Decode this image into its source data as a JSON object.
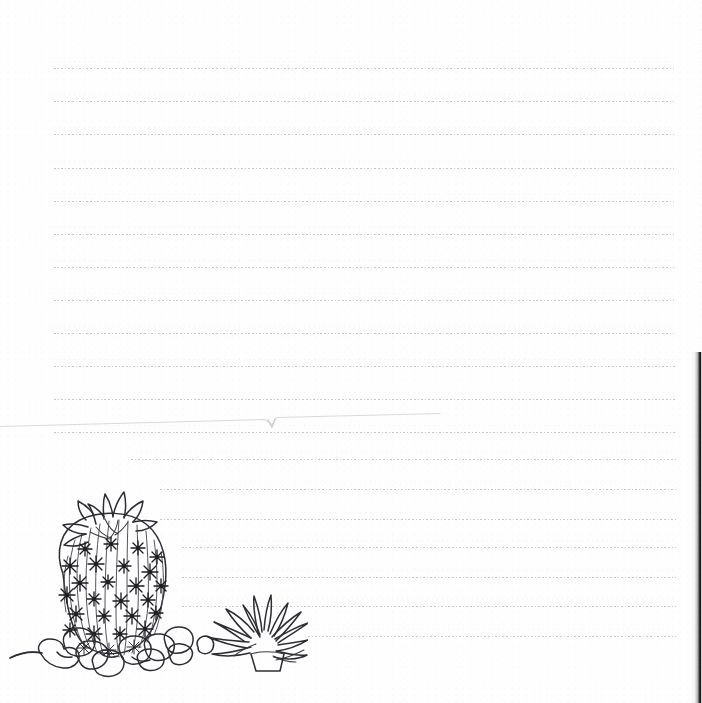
{
  "document": {
    "type": "lined-handwriting-worksheet",
    "title": "Blank lined page with cactus illustration",
    "background_color": "#ffffff",
    "rule_color": "#b9bcc4",
    "ink_color": "#2c2c33",
    "page_width": 702,
    "page_height": 703,
    "body_text": "",
    "header_text": "",
    "footer_text": ""
  },
  "rules": {
    "description": "Dotted handwriting guide lines; lower lines are indented to clear the illustration.",
    "line_count": 17,
    "lines": [
      {
        "index": 1,
        "y": 68,
        "x1": 54,
        "x2": 674
      },
      {
        "index": 2,
        "y": 101,
        "x1": 54,
        "x2": 674
      },
      {
        "index": 3,
        "y": 134,
        "x1": 54,
        "x2": 674
      },
      {
        "index": 4,
        "y": 168,
        "x1": 54,
        "x2": 674
      },
      {
        "index": 5,
        "y": 201,
        "x1": 54,
        "x2": 674
      },
      {
        "index": 6,
        "y": 234,
        "x1": 54,
        "x2": 674
      },
      {
        "index": 7,
        "y": 267,
        "x1": 54,
        "x2": 674
      },
      {
        "index": 8,
        "y": 300,
        "x1": 54,
        "x2": 674
      },
      {
        "index": 9,
        "y": 333,
        "x1": 54,
        "x2": 674
      },
      {
        "index": 10,
        "y": 366,
        "x1": 54,
        "x2": 676
      },
      {
        "index": 11,
        "y": 399,
        "x1": 54,
        "x2": 676
      },
      {
        "index": 12,
        "y": 432,
        "x1": 54,
        "x2": 676
      },
      {
        "index": 13,
        "y": 459,
        "x1": 131,
        "x2": 676
      },
      {
        "index": 14,
        "y": 489,
        "x1": 160,
        "x2": 676
      },
      {
        "index": 15,
        "y": 519,
        "x1": 160,
        "x2": 676
      },
      {
        "index": 16,
        "y": 547,
        "x1": 182,
        "x2": 676
      },
      {
        "index": 17,
        "y": 577,
        "x1": 182,
        "x2": 676
      },
      {
        "index": 18,
        "y": 606,
        "x1": 182,
        "x2": 676
      },
      {
        "index": 19,
        "y": 636,
        "x1": 308,
        "x2": 676
      }
    ]
  },
  "artifacts": {
    "page_edge_shadow": {
      "side": "right",
      "from_y": 352,
      "to_y": 703,
      "color": "#141414"
    },
    "scan_crease": {
      "description": "faint diagonal crease with a small notch near x=272",
      "y_left": 425,
      "y_right": 411
    }
  },
  "illustration": {
    "name": "barrel-cactus-with-rocks-and-agave",
    "style": "black-and-white line art",
    "elements": [
      {
        "name": "cactus-flower-crown",
        "label": "Flower crown"
      },
      {
        "name": "cactus-body",
        "label": "Ribbed barrel cactus body"
      },
      {
        "name": "cactus-spines",
        "label": "Star-shaped spine clusters"
      },
      {
        "name": "rocks",
        "label": "Rounded pebbles at base"
      },
      {
        "name": "agave-plant",
        "label": "Spiky agave succulent"
      },
      {
        "name": "small-stone",
        "label": "Small stone"
      },
      {
        "name": "ground-line",
        "label": "Ground line"
      }
    ]
  }
}
